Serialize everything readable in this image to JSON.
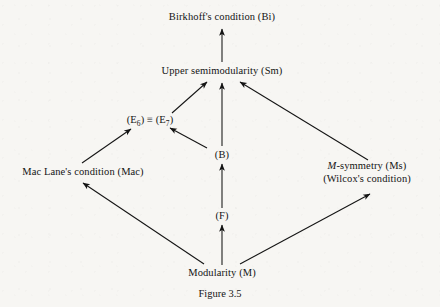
{
  "figure": {
    "caption": "Figure 3.5",
    "background_color": "#f7f6f3",
    "ink_color": "#141414"
  },
  "nodes": {
    "birkhoff": {
      "label": "Birkhoff's condition (Bi)",
      "x": 222,
      "y": 17
    },
    "upper_semimodularity": {
      "label": "Upper semimodularity (Sm)",
      "x": 222,
      "y": 71
    },
    "e6_e7": {
      "prefix": "(E",
      "sub1": "6",
      "mid": ") ≡ (E",
      "sub2": "7",
      "suffix": ")",
      "x": 150,
      "y": 120
    },
    "b": {
      "label": "(B)",
      "x": 222,
      "y": 155
    },
    "mac_lane": {
      "label": "Mac Lane's condition (Mac)",
      "x": 83,
      "y": 172
    },
    "m_symmetry": {
      "italic": "M",
      "rest": "-symmetry (Ms)",
      "line2": "(Wilcox's condition)",
      "x": 367,
      "y": 172
    },
    "f": {
      "label": "(F)",
      "x": 222,
      "y": 216
    },
    "modularity": {
      "label": "Modularity (M)",
      "x": 222,
      "y": 273
    }
  },
  "edges": [
    {
      "name": "sm-to-bi",
      "from": "upper_semimodularity",
      "to": "birkhoff",
      "x1": 222,
      "y1": 62,
      "x2": 222,
      "y2": 29
    },
    {
      "name": "e7-to-sm",
      "from": "e6_e7",
      "to": "upper_semimodularity",
      "x1": 172,
      "y1": 113,
      "x2": 207,
      "y2": 82
    },
    {
      "name": "b-to-sm",
      "from": "b",
      "to": "upper_semimodularity",
      "x1": 222,
      "y1": 146,
      "x2": 222,
      "y2": 83
    },
    {
      "name": "ms-to-sm",
      "from": "m_symmetry",
      "to": "upper_semimodularity",
      "x1": 368,
      "y1": 160,
      "x2": 240,
      "y2": 82
    },
    {
      "name": "mac-to-e6",
      "from": "mac_lane",
      "to": "e6_e7",
      "x1": 82,
      "y1": 163,
      "x2": 131,
      "y2": 129
    },
    {
      "name": "b-to-e7",
      "from": "b",
      "to": "e6_e7",
      "x1": 207,
      "y1": 148,
      "x2": 170,
      "y2": 128
    },
    {
      "name": "f-to-b",
      "from": "f",
      "to": "b",
      "x1": 222,
      "y1": 208,
      "x2": 222,
      "y2": 164
    },
    {
      "name": "m-to-f",
      "from": "modularity",
      "to": "f",
      "x1": 222,
      "y1": 265,
      "x2": 222,
      "y2": 225
    },
    {
      "name": "m-to-mac",
      "from": "modularity",
      "to": "mac_lane",
      "x1": 204,
      "y1": 264,
      "x2": 83,
      "y2": 183
    },
    {
      "name": "m-to-ms",
      "from": "modularity",
      "to": "m_symmetry",
      "x1": 240,
      "y1": 264,
      "x2": 370,
      "y2": 194
    }
  ]
}
